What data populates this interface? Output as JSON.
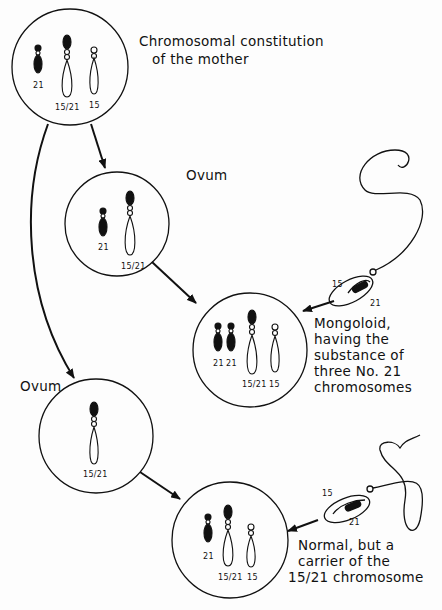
{
  "figure": {
    "colors": {
      "ink": "#111111",
      "background": "#fdfdfd"
    },
    "mother": {
      "label_line1": "Chromosomal constitution",
      "label_line2": "of the mother",
      "chromosomes": [
        "21",
        "15/21",
        "15"
      ]
    },
    "ovum1": {
      "label": "Ovum",
      "chromosomes": [
        "21",
        "15/21"
      ]
    },
    "ovum2": {
      "label": "Ovum",
      "chromosomes": [
        "15/21"
      ]
    },
    "sperm1": {
      "labels": [
        "15",
        "21"
      ]
    },
    "sperm2": {
      "labels": [
        "15",
        "21"
      ]
    },
    "mongoloid": {
      "chromosomes": [
        "21",
        "21",
        "15/21",
        "15"
      ],
      "description": [
        "Mongoloid,",
        "having the",
        "substance of",
        "three No. 21",
        "chromosomes"
      ]
    },
    "normal_carrier": {
      "chromosomes": [
        "21",
        "15/21",
        "15"
      ],
      "description": [
        "Normal, but a",
        "carrier of the",
        "15/21 chromosome"
      ]
    }
  }
}
